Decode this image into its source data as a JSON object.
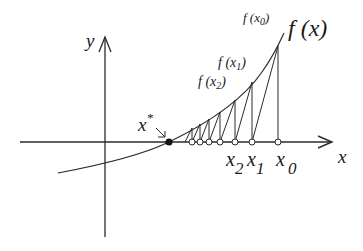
{
  "diagram": {
    "colors": {
      "ink": "#2a2a2a",
      "background": "#ffffff"
    },
    "axes": {
      "x_label": "x",
      "y_label": "y"
    },
    "curve_label": "f(x)",
    "root_label": "x*",
    "function_value_labels": [
      "f(x0)",
      "f(x1)",
      "f(x2)"
    ],
    "iterate_labels": [
      "x0",
      "x1",
      "x2"
    ],
    "labels": {
      "f_x0_base": "f (x",
      "f_x0_sub": "0",
      "f_x1_base": "f (x",
      "f_x1_sub": "1",
      "f_x2_base": "f (x",
      "f_x2_sub": "2",
      "close_paren": ")",
      "f_x": "f (x)",
      "x_star_base": "x",
      "x_star_sup": "*",
      "x0_base": "x",
      "x0_sub": "0",
      "x1_base": "x",
      "x1_sub": "1",
      "x2_base": "x",
      "x2_sub": "2",
      "x_axis": "x",
      "y_axis": "y"
    },
    "iterates_px": [
      {
        "x": 278,
        "fy": 46
      },
      {
        "x": 252,
        "fy": 82
      },
      {
        "x": 235,
        "fy": 100
      },
      {
        "x": 220,
        "fy": 112
      },
      {
        "x": 209,
        "fy": 119
      },
      {
        "x": 200,
        "fy": 124
      },
      {
        "x": 192,
        "fy": 128
      }
    ]
  }
}
